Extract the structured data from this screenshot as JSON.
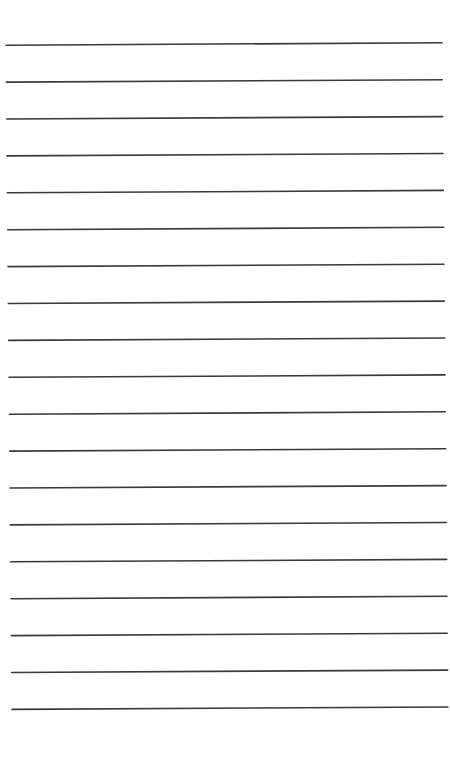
{
  "page": {
    "type": "lined-paper",
    "text": "",
    "rule_count": 19,
    "background_color": "#ffffff",
    "rule_color": "#3a3a3a"
  }
}
